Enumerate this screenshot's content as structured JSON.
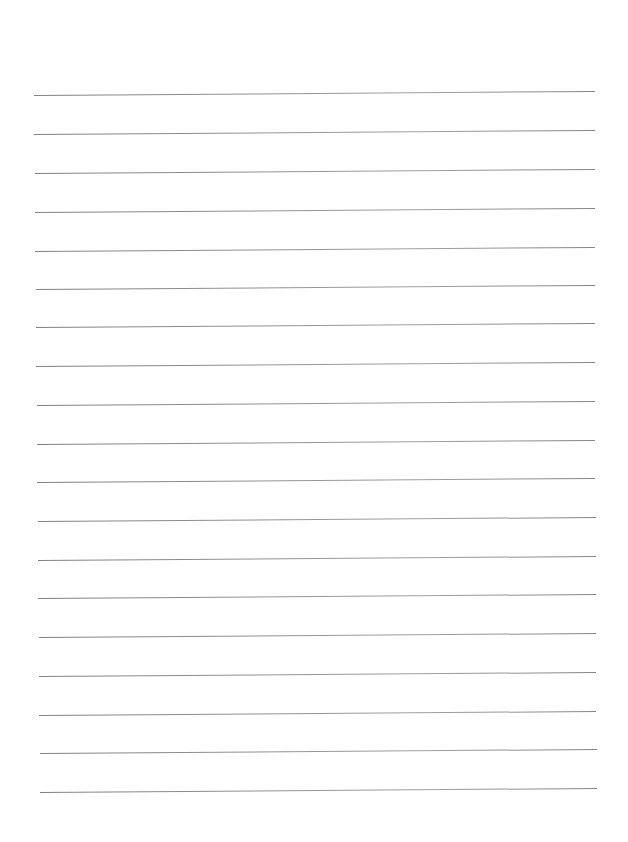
{
  "document": {
    "type": "lined-paper",
    "background_color": "#ffffff",
    "line_color": "#808080",
    "line_count": 19,
    "lines": [
      {
        "index": 1,
        "y_left": 95,
        "y_right": 91,
        "x_left": 34,
        "x_right": 595
      },
      {
        "index": 2,
        "y_left": 134,
        "y_right": 130,
        "x_left": 34,
        "x_right": 595
      },
      {
        "index": 3,
        "y_left": 173,
        "y_right": 169,
        "x_left": 35,
        "x_right": 595
      },
      {
        "index": 4,
        "y_left": 212,
        "y_right": 208,
        "x_left": 35,
        "x_right": 595
      },
      {
        "index": 5,
        "y_left": 251,
        "y_right": 247,
        "x_left": 35,
        "x_right": 595
      },
      {
        "index": 6,
        "y_left": 289,
        "y_right": 285,
        "x_left": 36,
        "x_right": 595
      },
      {
        "index": 7,
        "y_left": 327,
        "y_right": 323,
        "x_left": 36,
        "x_right": 595
      },
      {
        "index": 8,
        "y_left": 366,
        "y_right": 362,
        "x_left": 36,
        "x_right": 595
      },
      {
        "index": 9,
        "y_left": 405,
        "y_right": 401,
        "x_left": 37,
        "x_right": 595
      },
      {
        "index": 10,
        "y_left": 444,
        "y_right": 440,
        "x_left": 37,
        "x_right": 595
      },
      {
        "index": 11,
        "y_left": 482,
        "y_right": 478,
        "x_left": 37,
        "x_right": 595
      },
      {
        "index": 12,
        "y_left": 521,
        "y_right": 517,
        "x_left": 38,
        "x_right": 596
      },
      {
        "index": 13,
        "y_left": 560,
        "y_right": 556,
        "x_left": 38,
        "x_right": 596
      },
      {
        "index": 14,
        "y_left": 598,
        "y_right": 594,
        "x_left": 38,
        "x_right": 596
      },
      {
        "index": 15,
        "y_left": 637,
        "y_right": 633,
        "x_left": 39,
        "x_right": 596
      },
      {
        "index": 16,
        "y_left": 676,
        "y_right": 672,
        "x_left": 39,
        "x_right": 596
      },
      {
        "index": 17,
        "y_left": 715,
        "y_right": 711,
        "x_left": 39,
        "x_right": 596
      },
      {
        "index": 18,
        "y_left": 753,
        "y_right": 749,
        "x_left": 40,
        "x_right": 597
      },
      {
        "index": 19,
        "y_left": 792,
        "y_right": 788,
        "x_left": 40,
        "x_right": 597
      }
    ],
    "text_content": []
  }
}
